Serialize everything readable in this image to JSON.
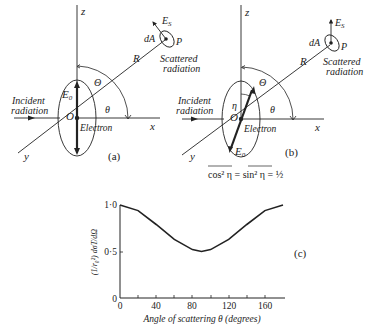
{
  "panel_a": {
    "label": "(a)",
    "axis_z": "z",
    "axis_x": "x",
    "axis_y": "y",
    "origin": "O",
    "field": "E",
    "field_sub": "0",
    "electron": "Electron",
    "incident_1": "Incident",
    "incident_2": "radiation",
    "R": "R",
    "Theta_big": "Θ",
    "theta": "θ",
    "dA": "dA",
    "P": "P",
    "Es": "E",
    "Es_sub": "S",
    "scattered_1": "Scattered",
    "scattered_2": "radiation"
  },
  "panel_b": {
    "label": "(b)",
    "axis_z": "z",
    "axis_x": "x",
    "axis_y": "y",
    "origin": "O",
    "field": "E",
    "field_sub": "0",
    "eta": "η",
    "electron": "Electron",
    "incident_1": "Incident",
    "incident_2": "radiation",
    "R": "R",
    "Theta_big": "Θ",
    "theta": "θ",
    "dA": "dA",
    "P": "P",
    "Es": "E",
    "Es_sub": "S",
    "scattered_1": "Scattered",
    "scattered_2": "radiation",
    "formula": "cos² η = sin² η = ½"
  },
  "chart_data": {
    "type": "line",
    "label": "(c)",
    "title": "",
    "xlabel": "Angle of scattering θ (degrees)",
    "ylabel": "(1/r₀²) dσT/dΩ",
    "x_ticks": [
      "0",
      "40",
      "80",
      "120",
      "160"
    ],
    "y_ticks": [
      "0",
      "0·5",
      "1·0"
    ],
    "xlim": [
      0,
      180
    ],
    "ylim": [
      0,
      1.0
    ],
    "grid": false,
    "series": [
      {
        "name": "(1+cos²θ)/2",
        "x": [
          0,
          20,
          40,
          60,
          80,
          90,
          100,
          120,
          140,
          160,
          180
        ],
        "y": [
          1.0,
          0.94,
          0.79,
          0.63,
          0.52,
          0.5,
          0.52,
          0.63,
          0.79,
          0.94,
          1.0
        ]
      }
    ]
  }
}
